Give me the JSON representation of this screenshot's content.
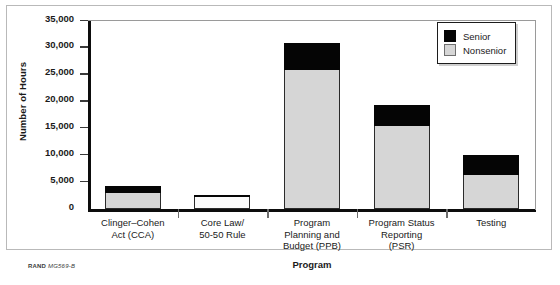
{
  "chart_data": {
    "type": "bar",
    "subtype": "stacked-vertical",
    "title": "",
    "xlabel": "Program",
    "ylabel": "Number of Hours",
    "ylim": [
      0,
      35000
    ],
    "ytick_values": [
      0,
      5000,
      10000,
      15000,
      20000,
      25000,
      30000,
      35000
    ],
    "ytick_labels": [
      "0",
      "5,000",
      "10,000",
      "15,000",
      "20,000",
      "25,000",
      "30,000",
      "35,000"
    ],
    "grid": false,
    "legend_position": "top-right",
    "categories": [
      "Clinger–Cohen\nAct (CCA)",
      "Core Law/\n50-50 Rule",
      "Program\nPlanning and\nBudget (PPB)",
      "Program Status\nReporting\n(PSR)",
      "Testing"
    ],
    "series": [
      {
        "name": "Nonsenior",
        "color": "#d6d6d6",
        "values": [
          2900,
          2300,
          25800,
          15500,
          6300
        ]
      },
      {
        "name": "Senior",
        "color": "#050505",
        "values": [
          1300,
          400,
          5100,
          3900,
          3700
        ]
      }
    ],
    "totals": [
      4200,
      2700,
      30900,
      19400,
      10000
    ]
  },
  "legend": {
    "items": [
      {
        "label": "Senior",
        "swatch": "black-square-icon"
      },
      {
        "label": "Nonsenior",
        "swatch": "gray-square-icon"
      }
    ]
  },
  "credit": {
    "org": "RAND",
    "ref": "MG569-B"
  }
}
